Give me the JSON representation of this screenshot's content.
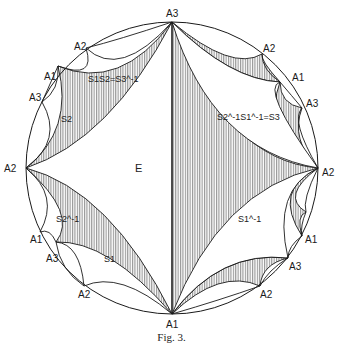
{
  "figure": {
    "caption": "Fig. 3.",
    "center_label": "E",
    "vertex_labels": {
      "top": "A3",
      "bottom": "A1",
      "left": "A2",
      "right": "A2",
      "upper_left_outer": "A2",
      "upper_left_mid": "A1",
      "upper_left_inner": "A3",
      "upper_right_outer": "A2",
      "upper_right_mid": "A1",
      "upper_right_inner": "A3",
      "lower_left_mid": "A1",
      "lower_left_inner": "A3",
      "lower_left_outer": "A2",
      "lower_right_mid": "A1",
      "lower_right_inner": "A3",
      "lower_right_outer": "A2"
    },
    "region_labels": {
      "upper_left": "S1S2=S3^-1",
      "left_upper": "S2",
      "left_lower": "S2^-1",
      "lower_left": "S1",
      "upper_right": "S2^-1S1^-1=S3",
      "lower_right": "S1^-1"
    },
    "colors": {
      "line": "#1a1a1a",
      "hatch": "#8a8a8a",
      "background": "#ffffff"
    }
  }
}
